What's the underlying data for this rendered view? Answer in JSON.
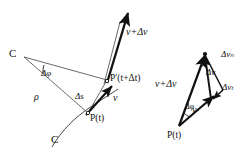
{
  "figure": {
    "background_color": "#ffffff",
    "stroke_color": "#111111",
    "thin_stroke_color": "#555555"
  },
  "left_diagram": {
    "name": "path-and-radius-of-curvature",
    "labels": {
      "center_of_curvature": "C",
      "curve": "C",
      "delta_phi": "Δφ",
      "rho": "ρ",
      "delta_s": "Δs",
      "point_p": "P(t)",
      "point_p_prime": "P′(t+Δt)",
      "velocity": "v",
      "velocity_plus_delta": "v+Δv"
    }
  },
  "right_diagram": {
    "name": "velocity-difference-triangle",
    "labels": {
      "point_p": "P(t)",
      "velocity": "v",
      "velocity_plus_delta": "v+Δv",
      "delta_v": "Δv",
      "delta_v_n": "Δvₙ",
      "delta_v_t": "Δvₜ",
      "delta_phi": "Δφ"
    }
  }
}
